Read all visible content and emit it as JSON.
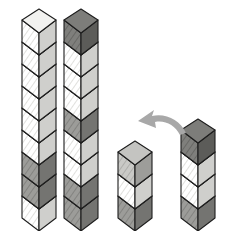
{
  "scene": {
    "title": "Isometric cube towers comparison",
    "background_color": "#ffffff",
    "width": 235,
    "height": 231,
    "cube": {
      "width": 34,
      "body_height": 22,
      "top_depth": 11,
      "skew": 13
    },
    "palette": {
      "light": "#e9e9e7",
      "light_top": "#f2f2f0",
      "light_right": "#cfcfcc",
      "medium": "#b5b5b2",
      "medium_top": "#c4c4c1",
      "medium_right": "#9d9d9a",
      "dark": "#8a8a87",
      "dark_top": "#999996",
      "dark_right": "#747471",
      "darker": "#6e6e6b",
      "darker_top": "#7d7d7a",
      "darker_right": "#5c5c59",
      "outline": "#1d1d1d",
      "arrow": "#a8a8a8"
    }
  },
  "towers": [
    {
      "name": "tower-1",
      "label": "Tall tower left",
      "origin_x": 22,
      "base_y": 218,
      "cube_count": 9,
      "cubes_bottom_to_top": [
        "light",
        "dark",
        "dark",
        "light",
        "light",
        "light",
        "light",
        "light",
        "light"
      ]
    },
    {
      "name": "tower-2",
      "label": "Tall tower right",
      "origin_x": 64,
      "base_y": 218,
      "cube_count": 9,
      "cubes_bottom_to_top": [
        "dark",
        "dark",
        "light",
        "light",
        "dark",
        "light",
        "light",
        "light",
        "darker"
      ]
    },
    {
      "name": "tower-3",
      "label": "Short tower of three",
      "origin_x": 118,
      "base_y": 218,
      "cube_count": 3,
      "cubes_bottom_to_top": [
        "dark",
        "light",
        "medium"
      ]
    },
    {
      "name": "tower-4",
      "label": "Short tower of four",
      "origin_x": 181,
      "base_y": 218,
      "cube_count": 4,
      "cubes_bottom_to_top": [
        "dark",
        "light",
        "light",
        "darker"
      ]
    }
  ],
  "arrow": {
    "name": "curved-arrow",
    "label": "Curved arrow pointing left",
    "color": "#a8a8a8",
    "direction": "left",
    "path": "M 186 133 C 180 120 166 113 152 116 L 154 110 L 138 121 L 156 128 L 155 122 C 165 120 175 125 180 135 Z"
  }
}
